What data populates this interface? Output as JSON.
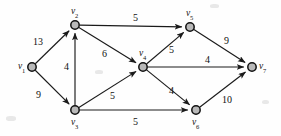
{
  "figure": {
    "kind": "directed-weighted-graph",
    "width": 281,
    "height": 136,
    "background_color": "#fefefe",
    "node_fill_color": "#b9b9b9",
    "node_stroke_color": "#111111",
    "edge_color": "#1a1a1a",
    "text_color": "#111111"
  },
  "nodes": [
    {
      "id": "v1",
      "name": "v",
      "subscript": "1",
      "x": 32,
      "y": 67,
      "label_dx": -14,
      "label_dy": -5
    },
    {
      "id": "v2",
      "name": "v",
      "subscript": "2",
      "x": 75,
      "y": 25,
      "label_dx": -4,
      "label_dy": -18
    },
    {
      "id": "v3",
      "name": "v",
      "subscript": "3",
      "x": 75,
      "y": 110,
      "label_dx": -4,
      "label_dy": 8
    },
    {
      "id": "v4",
      "name": "v",
      "subscript": "4",
      "x": 143,
      "y": 67,
      "label_dx": -4,
      "label_dy": -18
    },
    {
      "id": "v5",
      "name": "v",
      "subscript": "5",
      "x": 190,
      "y": 27,
      "label_dx": -4,
      "label_dy": -18
    },
    {
      "id": "v6",
      "name": "v",
      "subscript": "6",
      "x": 196,
      "y": 110,
      "label_dx": -4,
      "label_dy": 8
    },
    {
      "id": "v7",
      "name": "v",
      "subscript": "7",
      "x": 252,
      "y": 67,
      "label_dx": 7,
      "label_dy": -5
    }
  ],
  "edges": [
    {
      "id": "e-v1-v2",
      "from": "v1",
      "to": "v2",
      "weight": "13",
      "label_x": 33,
      "label_y": 37
    },
    {
      "id": "e-v1-v3",
      "from": "v1",
      "to": "v3",
      "weight": "9",
      "label_x": 36,
      "label_y": 90
    },
    {
      "id": "e-v3-v2",
      "from": "v3",
      "to": "v2",
      "weight": "4",
      "label_x": 64,
      "label_y": 62
    },
    {
      "id": "e-v2-v4",
      "from": "v2",
      "to": "v4",
      "weight": "6",
      "label_x": 102,
      "label_y": 49
    },
    {
      "id": "e-v3-v4",
      "from": "v3",
      "to": "v4",
      "weight": "5",
      "label_x": 110,
      "label_y": 91
    },
    {
      "id": "e-v2-v5",
      "from": "v2",
      "to": "v5",
      "weight": "5",
      "label_x": 133,
      "label_y": 13
    },
    {
      "id": "e-v4-v5",
      "from": "v4",
      "to": "v5",
      "weight": "5",
      "label_x": 169,
      "label_y": 45
    },
    {
      "id": "e-v4-v7",
      "from": "v4",
      "to": "v7",
      "weight": "4",
      "label_x": 205,
      "label_y": 55
    },
    {
      "id": "e-v4-v6",
      "from": "v4",
      "to": "v6",
      "weight": "4",
      "label_x": 169,
      "label_y": 86
    },
    {
      "id": "e-v3-v6",
      "from": "v3",
      "to": "v6",
      "weight": "5",
      "label_x": 133,
      "label_y": 117
    },
    {
      "id": "e-v5-v7",
      "from": "v5",
      "to": "v7",
      "weight": "9",
      "label_x": 224,
      "label_y": 36
    },
    {
      "id": "e-v6-v7",
      "from": "v6",
      "to": "v7",
      "weight": "10",
      "label_x": 222,
      "label_y": 95
    }
  ]
}
